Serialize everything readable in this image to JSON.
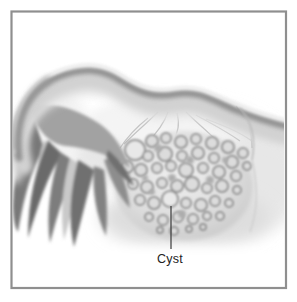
{
  "figure": {
    "label": {
      "text": "Cyst"
    },
    "frame_color": "#8f8f8f",
    "background": "#ffffff",
    "palette": {
      "tube_body": "#d3d3d3",
      "tube_shade": "#8d8d8d",
      "fimbriae_dark": "#6e6e6e",
      "ovary_base": "#e2e2e2",
      "cyst_ring": "#949494",
      "leader_line": "#3a3a3a",
      "label_color": "#222222"
    }
  }
}
